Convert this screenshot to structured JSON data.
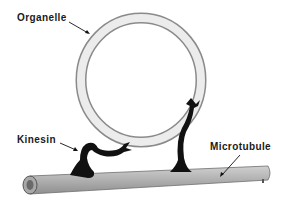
{
  "labels": {
    "organelle": "Organelle",
    "kinesin": "Kinesin",
    "microtubule": "Microtubule"
  },
  "colors": {
    "organelle_fill": "#e6e6e6",
    "organelle_edge": "#8a8a8a",
    "kinesin": "#111111",
    "microtubule_fill": "#b5b5b5",
    "microtubule_edge": "#6e6e6e"
  }
}
